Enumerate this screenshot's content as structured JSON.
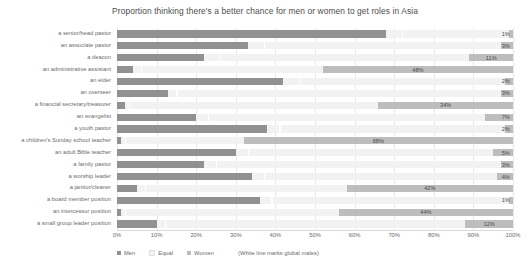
{
  "chart_data": {
    "type": "bar",
    "subtype": "stacked-horizontal-100",
    "title": "Proportion thinking there's a better chance for men or women to get roles in Asia",
    "xlabel": "",
    "ylabel": "",
    "xlim": [
      0,
      100
    ],
    "xticks": [
      "0%",
      "10%",
      "20%",
      "30%",
      "40%",
      "50%",
      "60%",
      "70%",
      "80%",
      "90%",
      "100%"
    ],
    "grid": true,
    "legend_position": "bottom",
    "legend": [
      "Men",
      "Equal",
      "Women"
    ],
    "note": "(White line marks global males)",
    "colors": {
      "men": "#919191",
      "equal": "#f2f2f2",
      "women": "#bdbdbd",
      "global_mark": "#ffffff",
      "grid": "#e8e8e8",
      "text": "#6b6b6b"
    },
    "categories": [
      "a senior/head pastor",
      "an associate pastor",
      "a deacon",
      "an administrative assistant",
      "an elder",
      "an overseer",
      "a financial secretary/treasurer",
      "an evangelist",
      "a youth pastor",
      "a children's Sunday school teacher",
      "an adult Bible teacher",
      "a family pastor",
      "a worship leader",
      "a janitor/cleaner",
      "a board member position",
      "an intercessor position",
      "a small group leader position"
    ],
    "series": [
      {
        "name": "Men",
        "values": [
          68,
          33,
          22,
          4,
          42,
          13,
          2,
          20,
          38,
          1,
          30,
          22,
          34,
          5,
          36,
          1,
          10
        ]
      },
      {
        "name": "Equal",
        "values": [
          31,
          64,
          67,
          48,
          56,
          84,
          64,
          73,
          60,
          31,
          65,
          75,
          62,
          53,
          63,
          55,
          78
        ]
      },
      {
        "name": "Women",
        "values": [
          1,
          3,
          11,
          48,
          2,
          3,
          34,
          7,
          2,
          68,
          5,
          3,
          4,
          42,
          1,
          44,
          12
        ]
      }
    ],
    "women_labels": [
      "1%",
      "3%",
      "11%",
      "48%",
      "2%",
      "3%",
      "34%",
      "7%",
      "2%",
      "68%",
      "5%",
      "3%",
      "4%",
      "42%",
      "1%",
      "44%",
      "12%"
    ],
    "global_males": [
      72,
      37,
      26,
      6,
      46,
      15,
      3,
      23,
      41,
      2,
      33,
      25,
      37,
      7,
      39,
      2,
      12
    ]
  }
}
